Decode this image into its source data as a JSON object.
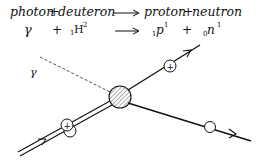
{
  "equation": {
    "words": {
      "lhs_a": "photon",
      "plus1": "+",
      "lhs_b": "deuteron",
      "rhs_a": "proton",
      "plus2": "+",
      "rhs_b": "neutron"
    },
    "symbols": {
      "gamma": "γ",
      "plus1": "+",
      "deuteron_sub": "1",
      "deuteron_sym": "H",
      "deuteron_sup": "2",
      "proton_sub": "1",
      "proton_sym": "p",
      "proton_sup": "1",
      "plus2": "+",
      "neutron_sub": "0",
      "neutron_sym": "n",
      "neutron_sup": "1"
    }
  },
  "diagram": {
    "photon_label": "γ",
    "deuteron_charge": "+",
    "proton_charge": "+",
    "ink_color": "#111111",
    "hatch_color": "#444444"
  }
}
